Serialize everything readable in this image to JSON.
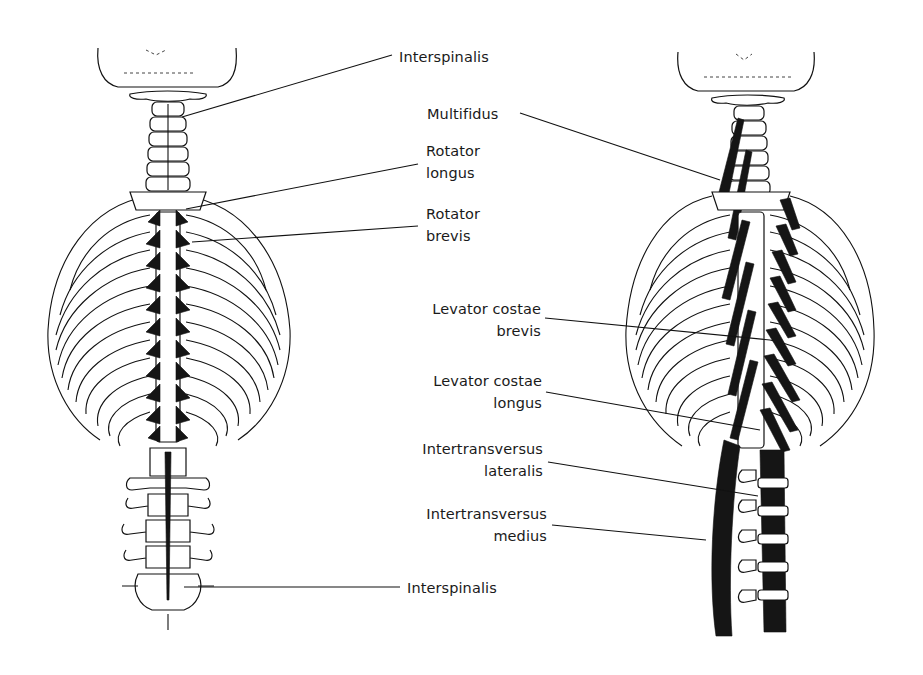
{
  "figure": {
    "left_panel": {
      "labels": [
        {
          "id": "interspinalis-top",
          "lines": [
            "Interspinalis"
          ],
          "x": 399,
          "y": 46
        },
        {
          "id": "rotator-longus",
          "lines": [
            "Rotator",
            "longus"
          ],
          "x": 426,
          "y": 140
        },
        {
          "id": "rotator-brevis",
          "lines": [
            "Rotator",
            "brevis"
          ],
          "x": 426,
          "y": 203
        },
        {
          "id": "interspinalis-bottom",
          "lines": [
            "Interspinalis"
          ],
          "x": 407,
          "y": 577
        }
      ]
    },
    "right_panel": {
      "labels": [
        {
          "id": "multifidus",
          "lines": [
            "Multifidus"
          ],
          "x": 427,
          "y": 103
        },
        {
          "id": "levator-costae-brevis",
          "lines": [
            "Levator costae",
            "brevis"
          ],
          "x": 411,
          "y": 298
        },
        {
          "id": "levator-costae-longus",
          "lines": [
            "Levator costae",
            "longus"
          ],
          "x": 412,
          "y": 370
        },
        {
          "id": "intertransversus-lateralis",
          "lines": [
            "Intertransversus",
            "lateralis"
          ],
          "x": 402,
          "y": 438
        },
        {
          "id": "intertransversus-medius",
          "lines": [
            "Intertransversus",
            "medius"
          ],
          "x": 406,
          "y": 503
        }
      ]
    },
    "colors": {
      "ink": "#111111",
      "background": "#ffffff"
    }
  }
}
